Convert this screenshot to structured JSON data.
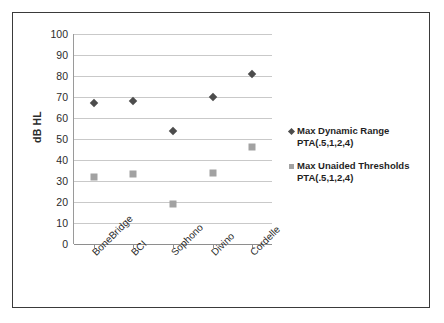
{
  "chart_data": {
    "type": "scatter",
    "title": "",
    "xlabel": "",
    "ylabel": "dB HL",
    "ylim": [
      0,
      100
    ],
    "yticks": [
      100,
      90,
      80,
      70,
      60,
      50,
      40,
      30,
      20,
      10,
      0
    ],
    "grid": true,
    "legend_position": "right",
    "categories": [
      "BoneBridge",
      "BCI",
      "Sophono",
      "Divino",
      "Cordelle"
    ],
    "series": [
      {
        "name": "Max Dynamic Range PTA(.5,1,2,4)",
        "name_line1": "Max Dynamic Range",
        "name_line2": "PTA(.5,1,2,4)",
        "marker": "diamond",
        "color": "#4c4c4c",
        "values": [
          67,
          68,
          54,
          70,
          81
        ]
      },
      {
        "name": "Max Unaided Thresholds PTA(.5,1,2,4)",
        "name_line1": "Max Unaided Thresholds",
        "name_line2": "PTA(.5,1,2,4)",
        "marker": "square",
        "color": "#a2a2a2",
        "values": [
          32,
          33.5,
          19,
          34,
          46
        ]
      }
    ]
  }
}
